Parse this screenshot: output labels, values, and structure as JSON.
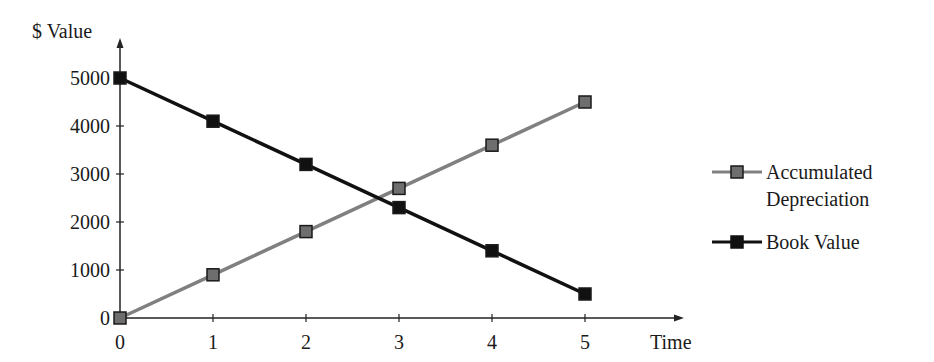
{
  "chart_data": {
    "type": "line",
    "title": "",
    "xlabel": "Time",
    "ylabel": "$ Value",
    "x": [
      0,
      1,
      2,
      3,
      4,
      5
    ],
    "xticks": [
      "0",
      "1",
      "2",
      "3",
      "4",
      "5"
    ],
    "yticks": [
      "0",
      "1000",
      "2000",
      "3000",
      "4000",
      "5000"
    ],
    "ylim": [
      0,
      5000
    ],
    "xlim": [
      0,
      5
    ],
    "grid": false,
    "legend_position": "right",
    "series": [
      {
        "name": "Accumulated Depreciation",
        "values": [
          0,
          900,
          1800,
          2700,
          3600,
          4500
        ],
        "color": "#808080",
        "marker": "square",
        "marker_fill": "#6e6e6e"
      },
      {
        "name": "Book Value",
        "values": [
          5000,
          4100,
          3200,
          2300,
          1400,
          500
        ],
        "color": "#111111",
        "marker": "square",
        "marker_fill": "#111111"
      }
    ]
  },
  "axes": {
    "y_title": "$ Value",
    "x_title": "Time"
  },
  "legend": {
    "items": [
      {
        "line1": "Accumulated",
        "line2": "Depreciation"
      },
      {
        "line1": "Book Value"
      }
    ]
  }
}
